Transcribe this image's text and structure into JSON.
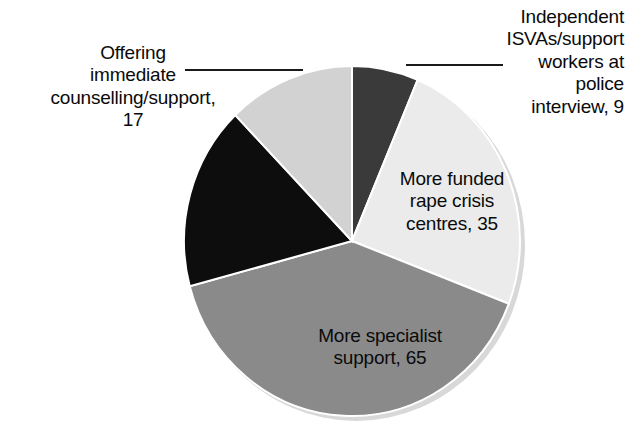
{
  "chart_data": {
    "type": "pie",
    "title": "",
    "subtitle": "",
    "xlabel": "",
    "ylabel": "",
    "legend_position": "none",
    "grid": false,
    "labels_show_value": true,
    "start_angle_deg": 0,
    "direction": "clockwise",
    "categories": [
      "Independent ISVAs/support workers at police interview",
      "More funded rape crisis centres",
      "More specialist support",
      "Offering immediate counselling/support",
      "Unlabelled segment"
    ],
    "values": [
      9,
      35,
      65,
      17,
      14
    ],
    "colors": [
      "#3a3a3a",
      "#ebebeb",
      "#8a8a8a",
      "#0d0d0d",
      "#d2d2d2"
    ],
    "slices": [
      {
        "name": "independent-isvas",
        "label": "Independent\nISVAs/support\nworkers at\npolice\ninterview, 9",
        "category": "Independent ISVAs/support workers at police interview",
        "value": 9,
        "color": "#3a3a3a",
        "start_deg": 0,
        "end_deg": 23,
        "label_placement": "outside",
        "leader_line": true
      },
      {
        "name": "more-funded-rape-crisis-centres",
        "label": "More funded\nrape crisis\ncentres, 35",
        "category": "More funded rape crisis centres",
        "value": 35,
        "color": "#ebebeb",
        "start_deg": 23,
        "end_deg": 111,
        "label_placement": "inside",
        "leader_line": false
      },
      {
        "name": "more-specialist-support",
        "label": "More specialist\nsupport, 65",
        "category": "More specialist support",
        "value": 65,
        "color": "#8a8a8a",
        "start_deg": 111,
        "end_deg": 255,
        "label_placement": "inside",
        "leader_line": false
      },
      {
        "name": "offering-immediate-counselling",
        "label": "Offering\nimmediate\ncounselling/support,\n17",
        "category": "Offering immediate counselling/support",
        "value": 17,
        "color": "#0d0d0d",
        "start_deg": 255,
        "end_deg": 316,
        "label_placement": "outside",
        "leader_line": true
      },
      {
        "name": "unlabelled-segment",
        "label": "",
        "category": "Unlabelled segment",
        "value": 14,
        "color": "#d2d2d2",
        "start_deg": 316,
        "end_deg": 360,
        "label_placement": "none",
        "leader_line": false
      }
    ]
  },
  "chart": {
    "background_color": "#ffffff",
    "text_color": "#0a0a0a",
    "leader_line_color": "#1a1a1a",
    "slice_edge_color": "#ffffff",
    "shadow_color": "#cfcfcf",
    "center_x": 352,
    "center_y": 241,
    "radius_x": 168,
    "radius_y": 175
  }
}
